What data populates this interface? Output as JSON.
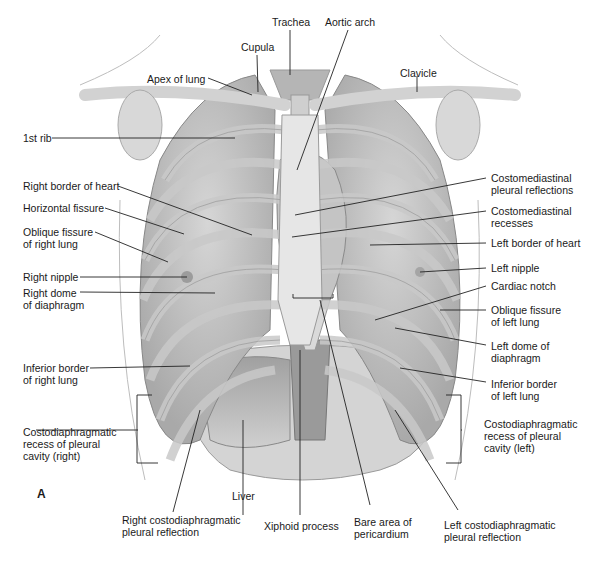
{
  "figure": {
    "panel_letter": "A",
    "colors": {
      "background": "#ffffff",
      "tissue_light": "#dcdcdc",
      "tissue_mid": "#b8b8b8",
      "tissue_dark": "#8e8e8e",
      "leader_line": "#222222",
      "text": "#1a1a1a"
    }
  },
  "labels": {
    "trachea": "Trachea",
    "aortic_arch": "Aortic arch",
    "cupula": "Cupula",
    "apex_of_lung": "Apex of lung",
    "clavicle": "Clavicle",
    "first_rib": "1st rib",
    "right_border_heart": "Right border of heart",
    "horizontal_fissure": "Horizontal fissure",
    "oblique_fissure_right": "Oblique fissure\nof right lung",
    "right_nipple": "Right nipple",
    "right_dome": "Right dome\nof diaphragm",
    "inferior_border_right": "Inferior border\nof right lung",
    "costodiaphragmatic_right": "Costodiaphragmatic\nrecess of pleural\ncavity (right)",
    "liver": "Liver",
    "right_costodiaphragmatic_reflection": "Right costodiaphragmatic\npleural reflection",
    "xiphoid": "Xiphoid process",
    "bare_area": "Bare area of\npericardium",
    "left_costodiaphragmatic_reflection": "Left costodiaphragmatic\npleural reflection",
    "costomediastinal_reflections": "Costomediastinal\npleural reflections",
    "costomediastinal_recesses": "Costomediastinal\nrecesses",
    "left_border_heart": "Left border of heart",
    "left_nipple": "Left nipple",
    "cardiac_notch": "Cardiac notch",
    "oblique_fissure_left": "Oblique fissure\nof left lung",
    "left_dome": "Left dome of\ndiaphragm",
    "inferior_border_left": "Inferior border\nof left lung",
    "costodiaphragmatic_left": "Costodiaphragmatic\nrecess of pleural\ncavity (left)"
  }
}
